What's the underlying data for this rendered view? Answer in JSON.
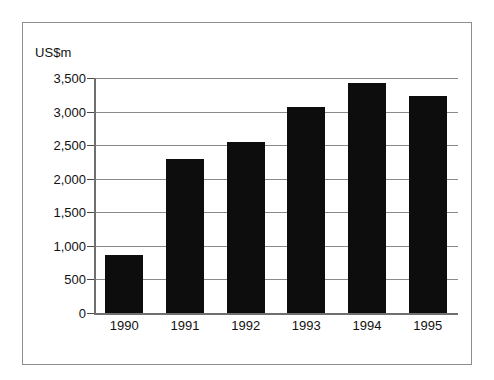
{
  "chart_data": {
    "type": "bar",
    "title": "",
    "subtitle": "",
    "xlabel": "",
    "ylabel": "US$m",
    "unit_label": "US$m",
    "categories": [
      "1990",
      "1991",
      "1992",
      "1993",
      "1994",
      "1995"
    ],
    "values": [
      870,
      2290,
      2540,
      3070,
      3430,
      3230
    ],
    "series": [
      {
        "name": "",
        "values": [
          870,
          2290,
          2540,
          3070,
          3430,
          3230
        ]
      }
    ],
    "ylim": [
      0,
      3500
    ],
    "ytick_values": [
      0,
      500,
      1000,
      1500,
      2000,
      2500,
      3000,
      3500
    ],
    "ytick_labels": [
      "0",
      "500",
      "1,000",
      "1,500",
      "2,000",
      "2,500",
      "3,000",
      "3,500"
    ],
    "grid": true,
    "grid_axis": "y",
    "legend": false,
    "legend_position": "none",
    "bar_color": "#0d0d0d",
    "grid_color": "#8a8a8a",
    "axis_color": "#6f6f6f",
    "frame_color": "#8d8d8d",
    "background_color": "#ffffff",
    "text_color": "#111111"
  }
}
